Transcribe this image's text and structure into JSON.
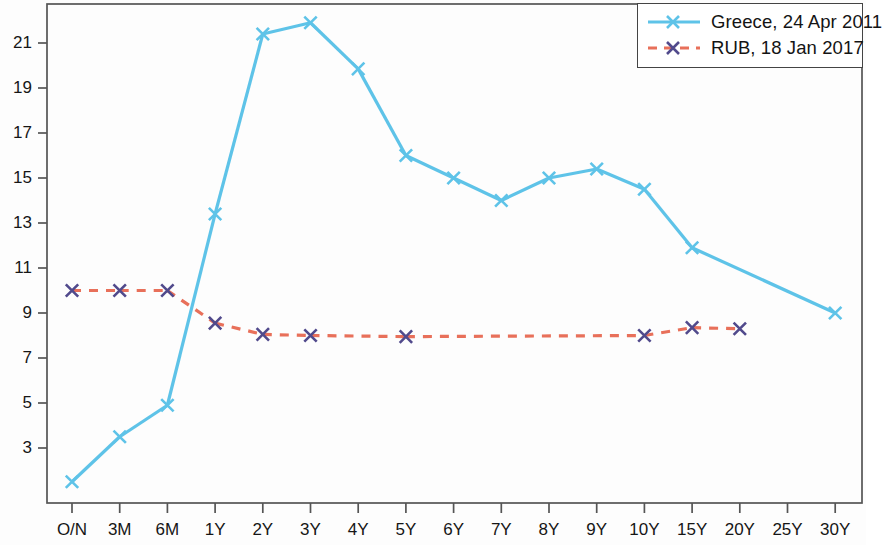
{
  "chart_data": {
    "type": "line",
    "title": "",
    "subtitle": "",
    "xlabel": "",
    "ylabel": "",
    "categories": [
      "O/N",
      "3M",
      "6M",
      "1Y",
      "2Y",
      "3Y",
      "4Y",
      "5Y",
      "6Y",
      "7Y",
      "8Y",
      "9Y",
      "10Y",
      "15Y",
      "20Y",
      "25Y",
      "30Y"
    ],
    "ylim": [
      1.0,
      22.6
    ],
    "yticks": [
      3,
      5,
      7,
      9,
      11,
      13,
      15,
      17,
      19,
      21
    ],
    "ytick_labels": [
      "3",
      "5",
      "7",
      "9",
      "11",
      "13",
      "15",
      "17",
      "19",
      "21"
    ],
    "grid": false,
    "legend_position": "top-right",
    "series": [
      {
        "name": "Greece, 24 Apr 2011",
        "color": "#5ec3e8",
        "linestyle": "solid",
        "marker": "x",
        "marker_color": "#5ec3e8",
        "values": [
          1.5,
          3.5,
          4.9,
          13.4,
          21.4,
          21.9,
          19.85,
          16.0,
          15.0,
          14.0,
          15.0,
          15.4,
          14.5,
          11.9,
          null,
          null,
          9.0
        ]
      },
      {
        "name": "RUB, 18 Jan 2017",
        "color": "#e8705a",
        "linestyle": "dashed",
        "marker": "x",
        "marker_color": "#514a8c",
        "values": [
          10.0,
          10.0,
          10.0,
          8.55,
          8.05,
          8.0,
          null,
          7.95,
          null,
          null,
          null,
          null,
          8.0,
          8.35,
          8.3,
          null,
          null
        ]
      }
    ]
  },
  "legend": {
    "entries": [
      {
        "label": "Greece, 24 Apr 2011"
      },
      {
        "label": "RUB, 18 Jan 2017"
      }
    ]
  },
  "axes": {
    "x_tick_labels": [
      "O/N",
      "3M",
      "6M",
      "1Y",
      "2Y",
      "3Y",
      "4Y",
      "5Y",
      "6Y",
      "7Y",
      "8Y",
      "9Y",
      "10Y",
      "15Y",
      "20Y",
      "25Y",
      "30Y"
    ],
    "y_tick_labels": [
      "21",
      "19",
      "17",
      "15",
      "13",
      "11",
      "9",
      "7",
      "5",
      "3"
    ]
  }
}
